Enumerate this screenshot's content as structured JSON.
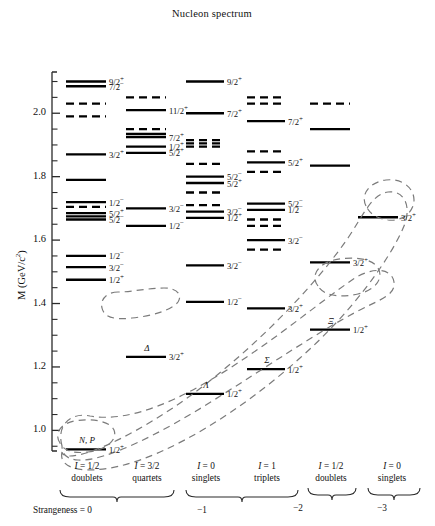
{
  "chart_data": {
    "type": "table",
    "title": "Nucleon spectrum",
    "ylabel": "M (GeV/c²)",
    "ylim": [
      0.94,
      2.13
    ],
    "yticks": [
      "1.0",
      "1.2",
      "1.4",
      "1.6",
      "1.8",
      "2.0"
    ],
    "ytick_values": [
      1.0,
      1.2,
      1.4,
      1.6,
      1.8,
      2.0
    ],
    "minor_tick_step": 0.05,
    "grid": false,
    "legend": "none",
    "columns": [
      {
        "id": "col-n-doublets",
        "isospin": "I = 1/2",
        "multiplet": "doublets",
        "strangeness": "0",
        "levels": [
          {
            "m": 2.1,
            "jp": "9/2",
            "par": "+",
            "style": "solid"
          },
          {
            "m": 2.085,
            "jp": "7/2",
            "par": "−",
            "style": "solid"
          },
          {
            "m": 2.03,
            "jp": "",
            "par": "",
            "style": "dashed"
          },
          {
            "m": 1.99,
            "jp": "",
            "par": "",
            "style": "dashed"
          },
          {
            "m": 1.87,
            "jp": "3/2",
            "par": "+",
            "style": "solid"
          },
          {
            "m": 1.79,
            "jp": "",
            "par": "",
            "style": "solid"
          },
          {
            "m": 1.72,
            "jp": "1/2",
            "par": "−",
            "style": "solid"
          },
          {
            "m": 1.705,
            "jp": "",
            "par": "",
            "style": "dashed"
          },
          {
            "m": 1.685,
            "jp": "5/2",
            "par": "+",
            "style": "solid"
          },
          {
            "m": 1.675,
            "jp": "",
            "par": "",
            "style": "solid"
          },
          {
            "m": 1.665,
            "jp": "5/2",
            "par": "−",
            "style": "solid"
          },
          {
            "m": 1.55,
            "jp": "1/2",
            "par": "−",
            "style": "solid"
          },
          {
            "m": 1.515,
            "jp": "3/2",
            "par": "−",
            "style": "solid"
          },
          {
            "m": 1.475,
            "jp": "1/2",
            "par": "+",
            "style": "solid"
          },
          {
            "m": 0.94,
            "jp": "1/2",
            "par": "+",
            "style": "solid",
            "particle": "N, P"
          }
        ]
      },
      {
        "id": "col-delta-quartets",
        "isospin": "I = 3/2",
        "multiplet": "quartets",
        "strangeness": "0",
        "levels": [
          {
            "m": 2.05,
            "jp": "",
            "par": "",
            "style": "dashed"
          },
          {
            "m": 2.01,
            "jp": "11/2",
            "par": "+",
            "style": "solid"
          },
          {
            "m": 1.95,
            "jp": "",
            "par": "",
            "style": "dashed"
          },
          {
            "m": 1.935,
            "jp": "",
            "par": "",
            "style": "solid"
          },
          {
            "m": 1.925,
            "jp": "7/2",
            "par": "+",
            "style": "solid"
          },
          {
            "m": 1.895,
            "jp": "1/2",
            "par": "+",
            "style": "solid"
          },
          {
            "m": 1.875,
            "jp": "5/2",
            "par": "+",
            "style": "solid"
          },
          {
            "m": 1.7,
            "jp": "3/2",
            "par": "−",
            "style": "solid"
          },
          {
            "m": 1.645,
            "jp": "1/2",
            "par": "−",
            "style": "solid"
          },
          {
            "m": 1.232,
            "jp": "3/2",
            "par": "+",
            "style": "solid",
            "particle": "Δ"
          }
        ]
      },
      {
        "id": "col-lambda-singlets",
        "isospin": "I = 0",
        "multiplet": "singlets",
        "strangeness": "-1",
        "levels": [
          {
            "m": 2.1,
            "jp": "9/2",
            "par": "+",
            "style": "solid"
          },
          {
            "m": 2.0,
            "jp": "7/2",
            "par": "+",
            "style": "solid"
          },
          {
            "m": 1.915,
            "jp": "",
            "par": "",
            "style": "dashed"
          },
          {
            "m": 1.905,
            "jp": "",
            "par": "",
            "style": "dashed"
          },
          {
            "m": 1.895,
            "jp": "",
            "par": "",
            "style": "dashed"
          },
          {
            "m": 1.84,
            "jp": "",
            "par": "",
            "style": "dashed"
          },
          {
            "m": 1.8,
            "jp": "5/2",
            "par": "−",
            "style": "solid"
          },
          {
            "m": 1.78,
            "jp": "5/2",
            "par": "+",
            "style": "solid"
          },
          {
            "m": 1.75,
            "jp": "",
            "par": "",
            "style": "dashed"
          },
          {
            "m": 1.71,
            "jp": "",
            "par": "",
            "style": "dashed"
          },
          {
            "m": 1.69,
            "jp": "3/2",
            "par": "−",
            "style": "solid"
          },
          {
            "m": 1.67,
            "jp": "1/2",
            "par": "+",
            "style": "solid"
          },
          {
            "m": 1.52,
            "jp": "3/2",
            "par": "−",
            "style": "solid"
          },
          {
            "m": 1.405,
            "jp": "1/2",
            "par": "−",
            "style": "solid"
          },
          {
            "m": 1.115,
            "jp": "1/2",
            "par": "+",
            "style": "solid",
            "particle": "Λ"
          }
        ]
      },
      {
        "id": "col-sigma-triplets",
        "isospin": "I = 1",
        "multiplet": "triplets",
        "strangeness": "-1",
        "levels": [
          {
            "m": 2.05,
            "jp": "",
            "par": "",
            "style": "dashed"
          },
          {
            "m": 2.03,
            "jp": "",
            "par": "",
            "style": "dashed"
          },
          {
            "m": 1.975,
            "jp": "7/2",
            "par": "+",
            "style": "solid"
          },
          {
            "m": 1.88,
            "jp": "",
            "par": "",
            "style": "dashed"
          },
          {
            "m": 1.845,
            "jp": "5/2",
            "par": "+",
            "style": "solid"
          },
          {
            "m": 1.815,
            "jp": "",
            "par": "",
            "style": "dashed"
          },
          {
            "m": 1.715,
            "jp": "5/2",
            "par": "−",
            "style": "solid"
          },
          {
            "m": 1.695,
            "jp": "1/2",
            "par": "−",
            "style": "solid"
          },
          {
            "m": 1.665,
            "jp": "",
            "par": "",
            "style": "dashed"
          },
          {
            "m": 1.645,
            "jp": "",
            "par": "",
            "style": "dashed"
          },
          {
            "m": 1.6,
            "jp": "3/2",
            "par": "−",
            "style": "solid"
          },
          {
            "m": 1.57,
            "jp": "",
            "par": "",
            "style": "dashed"
          },
          {
            "m": 1.385,
            "jp": "3/2",
            "par": "+",
            "style": "solid"
          },
          {
            "m": 1.193,
            "jp": "1/2",
            "par": "+",
            "style": "solid",
            "particle": "Σ"
          }
        ]
      },
      {
        "id": "col-xi-doublets",
        "isospin": "I = 1/2",
        "multiplet": "doublets",
        "strangeness": "-2",
        "levels": [
          {
            "m": 2.03,
            "jp": "",
            "par": "",
            "style": "dashed"
          },
          {
            "m": 1.95,
            "jp": "",
            "par": "",
            "style": "solid"
          },
          {
            "m": 1.835,
            "jp": "",
            "par": "",
            "style": "solid"
          },
          {
            "m": 1.53,
            "jp": "3/2",
            "par": "+",
            "style": "solid"
          },
          {
            "m": 1.318,
            "jp": "1/2",
            "par": "+",
            "style": "solid",
            "particle": "Ξ"
          }
        ]
      },
      {
        "id": "col-omega-singlets",
        "isospin": "I = 0",
        "multiplet": "singlets",
        "strangeness": "-3",
        "levels": [
          {
            "m": 1.672,
            "jp": "3/2",
            "par": "+",
            "style": "solid"
          }
        ]
      }
    ],
    "strangeness_groups": [
      {
        "label_prefix": "Strangeness =",
        "label": "0",
        "columns": [
          "col-n-doublets",
          "col-delta-quartets"
        ]
      },
      {
        "label_prefix": "",
        "label": "−1",
        "columns": [
          "col-lambda-singlets",
          "col-sigma-triplets"
        ]
      },
      {
        "label_prefix": "",
        "label": "−2",
        "columns": [
          "col-xi-doublets"
        ]
      },
      {
        "label_prefix": "",
        "label": "−3",
        "columns": [
          "col-omega-singlets"
        ]
      }
    ],
    "ground_state_bands": [
      {
        "name": "baryon-octet-band",
        "members": [
          "N, P",
          "Λ",
          "Σ",
          "Ξ"
        ]
      },
      {
        "name": "baryon-decuplet-band",
        "members": [
          "Δ",
          "Σ(1385)",
          "Ξ(1530)",
          "Ω"
        ]
      }
    ]
  },
  "chart": {
    "title": "Nucleon spectrum",
    "ylabel": "M (GeV/c",
    "ylabel_sup": "2",
    "ylabel_tail": ")",
    "ytick_labels": [
      "2.0",
      "1.8",
      "1.6",
      "1.4",
      "1.2",
      "1.0"
    ]
  },
  "columns_header": [
    {
      "iso": "I",
      "eq": "= 1/2",
      "mult": "doublets"
    },
    {
      "iso": "I",
      "eq": "= 3/2",
      "mult": "quartets"
    },
    {
      "iso": "I",
      "eq": "= 0",
      "mult": "singlets"
    },
    {
      "iso": "I",
      "eq": "= 1",
      "mult": "triplets"
    },
    {
      "iso": "I",
      "eq": "= 1/2",
      "mult": "doublets"
    },
    {
      "iso": "I",
      "eq": "= 0",
      "mult": "singlets"
    }
  ],
  "strangeness": {
    "prefix": "Strangeness  =  0",
    "s1": "−1",
    "s2": "−2",
    "s3": "−3"
  }
}
